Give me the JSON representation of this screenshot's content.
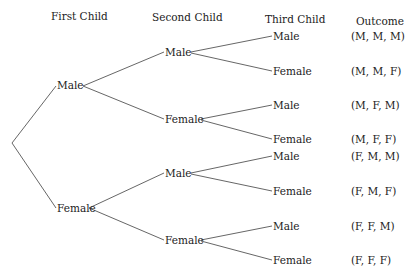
{
  "headers": {
    "first": "First Child",
    "second": "Second Child",
    "third": "Third Child",
    "outcome": "Outcome"
  },
  "level1": [
    {
      "label": "Male"
    },
    {
      "label": "Female"
    }
  ],
  "level2": [
    {
      "label": "Male"
    },
    {
      "label": "Female"
    },
    {
      "label": "Male"
    },
    {
      "label": "Female"
    }
  ],
  "level3": [
    {
      "label": "Male"
    },
    {
      "label": "Female"
    },
    {
      "label": "Male"
    },
    {
      "label": "Female"
    },
    {
      "label": "Male"
    },
    {
      "label": "Female"
    },
    {
      "label": "Male"
    },
    {
      "label": "Female"
    }
  ],
  "outcomes": [
    "(M, M, M)",
    "(M, M, F)",
    "(M, F, M)",
    "(M, F, F)",
    "(F, M, M)",
    "(F, M, F)",
    "(F, F, M)",
    "(F, F, F)"
  ],
  "colors": {
    "line": "#555555",
    "text": "#222222",
    "background": "#ffffff"
  }
}
